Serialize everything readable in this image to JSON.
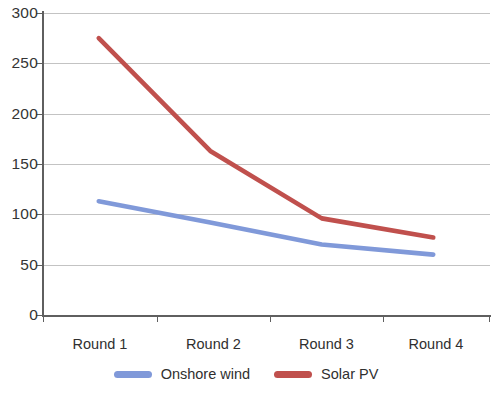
{
  "chart_data": {
    "type": "line",
    "title": "",
    "subtitle": "",
    "xlabel": "",
    "ylabel": "",
    "categories": [
      "Round 1",
      "Round  2",
      "Round 3",
      "Round 4"
    ],
    "series": [
      {
        "name": "Onshore wind",
        "color": "#8099d9",
        "values": [
          113,
          92,
          70,
          60
        ]
      },
      {
        "name": "Solar PV",
        "color": "#c0504d",
        "values": [
          275,
          163,
          96,
          77
        ]
      }
    ],
    "ylim": [
      0,
      300
    ],
    "yticks": [
      0,
      50,
      100,
      150,
      200,
      250,
      300
    ],
    "ytick_labels": [
      "0",
      "50",
      "100",
      "150",
      "200",
      "250",
      "300"
    ],
    "grid": {
      "horizontal": true,
      "vertical": false
    },
    "legend": {
      "position": "bottom",
      "entries": [
        "Onshore wind",
        "Solar PV"
      ]
    },
    "markers": false,
    "line_width": 4
  },
  "axis": {
    "y_labels": [
      "300",
      "250",
      "200",
      "150",
      "100",
      "50",
      "0"
    ],
    "x_labels": [
      "Round 1",
      "Round  2",
      "Round 3",
      "Round 4"
    ]
  },
  "legend": {
    "items": [
      {
        "label": "Onshore wind",
        "color": "#8099d9"
      },
      {
        "label": "Solar PV",
        "color": "#c0504d"
      }
    ]
  }
}
